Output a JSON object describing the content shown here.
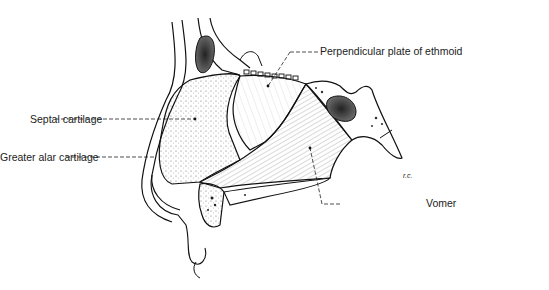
{
  "figure": {
    "type": "anatomical-illustration",
    "labels": [
      {
        "id": "perpendicular",
        "text": "Perpendicular plate of ethmoid"
      },
      {
        "id": "septal",
        "text": "Septal cartilage"
      },
      {
        "id": "alar",
        "text": "Greater alar cartilage"
      },
      {
        "id": "vomer",
        "text": "Vomer"
      }
    ],
    "signature": "r.c."
  }
}
